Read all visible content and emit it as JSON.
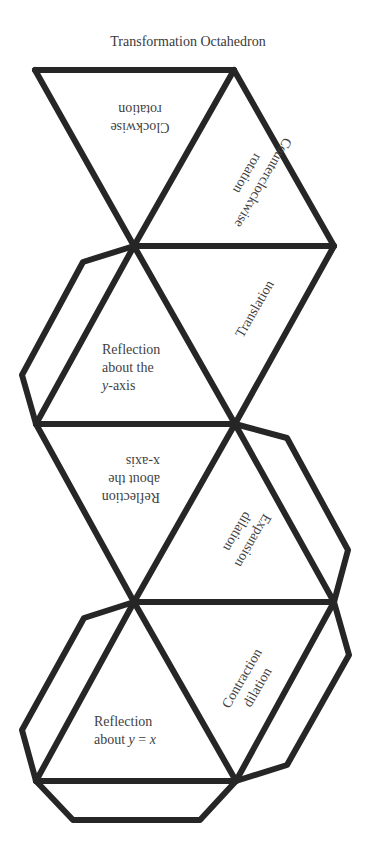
{
  "title": "Transformation Octahedron",
  "faces": {
    "clockwise": {
      "line1": "Clockwise",
      "line2": "rotation"
    },
    "counterclockwise": {
      "line1": "Counterclockwise",
      "line2": "rotation"
    },
    "translation": {
      "line1": "Translation"
    },
    "reflection_y_axis": {
      "line1": "Reflection",
      "line2": "about the",
      "line3_var": "y",
      "line3_rest": "-axis"
    },
    "reflection_x_axis": {
      "line1": "Reflection",
      "line2": "about the",
      "line3": "x-axis"
    },
    "expansion": {
      "line1": "Expansion",
      "line2": "dilation"
    },
    "contraction": {
      "line1": "Contraction",
      "line2": "dilation"
    },
    "reflection_y_eq_x": {
      "line1": "Reflection",
      "line2_pre": "about ",
      "line2_var1": "y",
      "line2_eq": " = ",
      "line2_var2": "x"
    }
  },
  "colors": {
    "stroke": "#262626",
    "text": "#3f3f3f",
    "background": "#ffffff"
  }
}
